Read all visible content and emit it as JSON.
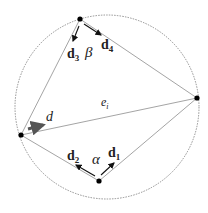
{
  "diagram": {
    "circle": {
      "cx": 107,
      "cy": 107,
      "r": 92,
      "style": "dashed"
    },
    "vertices": [
      {
        "id": "top",
        "x": 80,
        "y": 19
      },
      {
        "id": "right",
        "x": 197,
        "y": 98
      },
      {
        "id": "left",
        "x": 21,
        "y": 135
      },
      {
        "id": "bottom",
        "x": 99,
        "y": 181
      }
    ],
    "labels": {
      "d3": {
        "base": "d",
        "sub": "3"
      },
      "d4": {
        "base": "d",
        "sub": "4"
      },
      "beta": "β",
      "e_i": {
        "base": "e",
        "sub": "i"
      },
      "d": "d",
      "d2": {
        "base": "d",
        "sub": "2"
      },
      "alpha": "α",
      "d1": {
        "base": "d",
        "sub": "1"
      }
    },
    "colors": {
      "edge": "#9a9a9a",
      "circle": "#777777",
      "vertex": "#000000",
      "arrow": "#111111",
      "thick_arrow": "#555555"
    }
  }
}
